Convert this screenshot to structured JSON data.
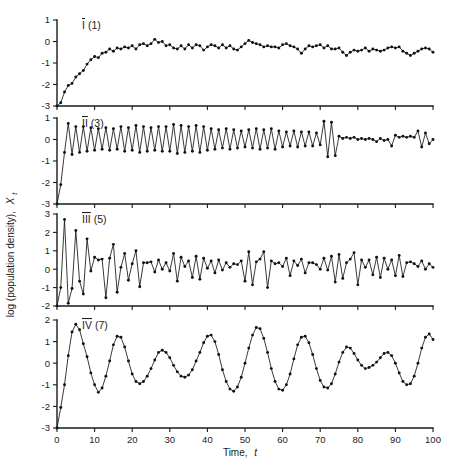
{
  "figure": {
    "y_axis_label_main": "log (population density),",
    "y_axis_label_symbol": "X",
    "y_axis_label_subscript": "t",
    "x_axis_label_main": "Time,",
    "x_axis_label_symbol": "t",
    "background_color": "#ffffff",
    "line_color": "#161616",
    "marker_color": "#111111"
  },
  "chart_data": [
    {
      "type": "line",
      "title": "I (1)",
      "panel_id": "I",
      "panel_number": "(1)",
      "xlabel": "Time, t",
      "ylabel": "log (population density), Xt",
      "xlim": [
        0,
        100
      ],
      "ylim": [
        -3,
        1
      ],
      "xticks": [
        0,
        10,
        20,
        30,
        40,
        50,
        60,
        70,
        80,
        90,
        100
      ],
      "yticks": [
        1,
        0,
        -1,
        -2,
        -3
      ],
      "grid": false,
      "legend": "none",
      "markers": "filled-circle",
      "x": [
        0,
        1,
        2,
        3,
        4,
        5,
        6,
        7,
        8,
        9,
        10,
        11,
        12,
        13,
        14,
        15,
        16,
        17,
        18,
        19,
        20,
        21,
        22,
        23,
        24,
        25,
        26,
        27,
        28,
        29,
        30,
        31,
        32,
        33,
        34,
        35,
        36,
        37,
        38,
        39,
        40,
        41,
        42,
        43,
        44,
        45,
        46,
        47,
        48,
        49,
        50,
        51,
        52,
        53,
        54,
        55,
        56,
        57,
        58,
        59,
        60,
        61,
        62,
        63,
        64,
        65,
        66,
        67,
        68,
        69,
        70,
        71,
        72,
        73,
        74,
        75,
        76,
        77,
        78,
        79,
        80,
        81,
        82,
        83,
        84,
        85,
        86,
        87,
        88,
        89,
        90,
        91,
        92,
        93,
        94,
        95,
        96,
        97,
        98,
        99,
        100
      ],
      "values": [
        -3.0,
        -2.85,
        -2.35,
        -2.05,
        -1.95,
        -1.65,
        -1.5,
        -1.35,
        -1.05,
        -0.85,
        -0.7,
        -0.75,
        -0.55,
        -0.5,
        -0.35,
        -0.45,
        -0.3,
        -0.35,
        -0.25,
        -0.3,
        -0.2,
        -0.35,
        -0.15,
        -0.1,
        -0.2,
        -0.1,
        0.1,
        -0.05,
        0.0,
        -0.2,
        -0.15,
        -0.3,
        -0.35,
        -0.2,
        -0.35,
        -0.15,
        -0.3,
        -0.15,
        -0.2,
        -0.4,
        -0.25,
        -0.15,
        -0.2,
        -0.3,
        -0.15,
        -0.3,
        -0.2,
        -0.35,
        -0.4,
        -0.25,
        -0.1,
        0.05,
        -0.05,
        -0.1,
        -0.15,
        -0.25,
        -0.2,
        -0.25,
        -0.25,
        -0.3,
        -0.15,
        -0.1,
        -0.2,
        -0.25,
        -0.35,
        -0.55,
        -0.35,
        -0.2,
        -0.25,
        -0.2,
        -0.15,
        -0.3,
        -0.2,
        -0.35,
        -0.35,
        -0.3,
        -0.5,
        -0.65,
        -0.5,
        -0.4,
        -0.45,
        -0.4,
        -0.3,
        -0.45,
        -0.35,
        -0.4,
        -0.45,
        -0.4,
        -0.3,
        -0.25,
        -0.3,
        -0.25,
        -0.45,
        -0.55,
        -0.65,
        -0.55,
        -0.45,
        -0.35,
        -0.3,
        -0.35,
        -0.5
      ]
    },
    {
      "type": "line",
      "title": "II (3)",
      "panel_id": "II",
      "panel_number": "(3)",
      "xlabel": "Time, t",
      "ylabel": "log (population density), Xt",
      "xlim": [
        0,
        100
      ],
      "ylim": [
        -3,
        1
      ],
      "xticks": [
        0,
        10,
        20,
        30,
        40,
        50,
        60,
        70,
        80,
        90,
        100
      ],
      "yticks": [
        1,
        0,
        -1,
        -2,
        -3
      ],
      "grid": false,
      "legend": "none",
      "markers": "filled-circle",
      "x": [
        0,
        1,
        2,
        3,
        4,
        5,
        6,
        7,
        8,
        9,
        10,
        11,
        12,
        13,
        14,
        15,
        16,
        17,
        18,
        19,
        20,
        21,
        22,
        23,
        24,
        25,
        26,
        27,
        28,
        29,
        30,
        31,
        32,
        33,
        34,
        35,
        36,
        37,
        38,
        39,
        40,
        41,
        42,
        43,
        44,
        45,
        46,
        47,
        48,
        49,
        50,
        51,
        52,
        53,
        54,
        55,
        56,
        57,
        58,
        59,
        60,
        61,
        62,
        63,
        64,
        65,
        66,
        67,
        68,
        69,
        70,
        71,
        72,
        73,
        74,
        75,
        76,
        77,
        78,
        79,
        80,
        81,
        82,
        83,
        84,
        85,
        86,
        87,
        88,
        89,
        90,
        91,
        92,
        93,
        94,
        95,
        96,
        97,
        98,
        99,
        100
      ],
      "values": [
        -3.0,
        -2.1,
        -0.6,
        0.75,
        -0.7,
        0.6,
        -0.6,
        0.6,
        -0.55,
        0.55,
        -0.5,
        0.5,
        -0.45,
        0.55,
        -0.5,
        0.5,
        -0.45,
        0.6,
        -0.55,
        0.55,
        -0.5,
        0.65,
        -0.6,
        0.6,
        -0.55,
        0.55,
        -0.5,
        0.6,
        -0.55,
        0.6,
        -0.55,
        0.7,
        -0.65,
        0.65,
        -0.6,
        0.6,
        -0.55,
        0.65,
        -0.6,
        0.6,
        -0.5,
        0.5,
        -0.45,
        0.45,
        -0.4,
        0.5,
        -0.45,
        0.45,
        -0.4,
        0.4,
        -0.35,
        0.45,
        -0.4,
        0.5,
        -0.45,
        0.45,
        -0.4,
        0.5,
        -0.45,
        0.4,
        -0.35,
        0.35,
        -0.3,
        0.4,
        -0.35,
        0.35,
        -0.3,
        0.35,
        -0.3,
        0.3,
        -0.25,
        0.85,
        -0.8,
        0.8,
        -0.75,
        0.15,
        0.05,
        0.1,
        0.05,
        0.1,
        0.0,
        0.05,
        0.0,
        0.05,
        0.0,
        -0.1,
        0.05,
        -0.05,
        0.0,
        -0.3,
        0.2,
        0.1,
        0.15,
        0.1,
        0.15,
        0.1,
        0.4,
        -0.35,
        0.3,
        -0.2,
        0.0
      ]
    },
    {
      "type": "line",
      "title": "III (5)",
      "panel_id": "III",
      "panel_number": "(5)",
      "xlabel": "Time, t",
      "ylabel": "log (population density), Xt",
      "xlim": [
        0,
        100
      ],
      "ylim": [
        -2,
        3
      ],
      "xticks": [
        0,
        10,
        20,
        30,
        40,
        50,
        60,
        70,
        80,
        90,
        100
      ],
      "yticks": [
        3,
        2,
        1,
        0,
        -1,
        -2
      ],
      "grid": false,
      "legend": "none",
      "markers": "filled-circle",
      "x": [
        0,
        1,
        2,
        3,
        4,
        5,
        6,
        7,
        8,
        9,
        10,
        11,
        12,
        13,
        14,
        15,
        16,
        17,
        18,
        19,
        20,
        21,
        22,
        23,
        24,
        25,
        26,
        27,
        28,
        29,
        30,
        31,
        32,
        33,
        34,
        35,
        36,
        37,
        38,
        39,
        40,
        41,
        42,
        43,
        44,
        45,
        46,
        47,
        48,
        49,
        50,
        51,
        52,
        53,
        54,
        55,
        56,
        57,
        58,
        59,
        60,
        61,
        62,
        63,
        64,
        65,
        66,
        67,
        68,
        69,
        70,
        71,
        72,
        73,
        74,
        75,
        76,
        77,
        78,
        79,
        80,
        81,
        82,
        83,
        84,
        85,
        86,
        87,
        88,
        89,
        90,
        91,
        92,
        93,
        94,
        95,
        96,
        97,
        98,
        99,
        100
      ],
      "values": [
        -2.0,
        -1.0,
        2.7,
        -1.85,
        -1.05,
        2.1,
        -0.65,
        -1.35,
        1.65,
        -0.1,
        0.65,
        0.5,
        0.55,
        -1.55,
        0.6,
        1.35,
        -1.25,
        0.1,
        0.85,
        -0.6,
        0.3,
        1.0,
        -0.95,
        0.35,
        0.35,
        0.4,
        -0.15,
        0.5,
        0.0,
        0.35,
        -0.1,
        0.85,
        -0.65,
        0.65,
        0.15,
        0.45,
        -0.45,
        0.7,
        -0.55,
        0.6,
        0.05,
        0.45,
        -0.2,
        0.5,
        -0.05,
        0.35,
        0.1,
        0.3,
        0.25,
        0.45,
        -0.65,
        0.95,
        -0.85,
        0.4,
        0.55,
        0.95,
        -1.0,
        0.45,
        0.3,
        0.35,
        0.15,
        0.6,
        -0.35,
        0.45,
        0.2,
        0.55,
        -0.2,
        0.35,
        0.35,
        0.25,
        0.0,
        0.6,
        -0.05,
        0.7,
        -0.7,
        0.8,
        -0.5,
        0.35,
        0.55,
        0.9,
        -0.85,
        0.5,
        0.1,
        0.5,
        -0.3,
        0.65,
        -0.45,
        0.6,
        0.0,
        0.5,
        -0.35,
        0.75,
        -0.4,
        0.35,
        0.4,
        0.3,
        0.15,
        0.45,
        0.0,
        0.3,
        0.1
      ]
    },
    {
      "type": "line",
      "title": "IV (7)",
      "panel_id": "IV",
      "panel_number": "(7)",
      "xlabel": "Time, t",
      "ylabel": "log (population density), Xt",
      "xlim": [
        0,
        100
      ],
      "ylim": [
        -3,
        2
      ],
      "xticks": [
        0,
        10,
        20,
        30,
        40,
        50,
        60,
        70,
        80,
        90,
        100
      ],
      "yticks": [
        2,
        1,
        0,
        -1,
        -2,
        -3
      ],
      "grid": false,
      "legend": "none",
      "markers": "filled-circle",
      "x": [
        0,
        1,
        2,
        3,
        4,
        5,
        6,
        7,
        8,
        9,
        10,
        11,
        12,
        13,
        14,
        15,
        16,
        17,
        18,
        19,
        20,
        21,
        22,
        23,
        24,
        25,
        26,
        27,
        28,
        29,
        30,
        31,
        32,
        33,
        34,
        35,
        36,
        37,
        38,
        39,
        40,
        41,
        42,
        43,
        44,
        45,
        46,
        47,
        48,
        49,
        50,
        51,
        52,
        53,
        54,
        55,
        56,
        57,
        58,
        59,
        60,
        61,
        62,
        63,
        64,
        65,
        66,
        67,
        68,
        69,
        70,
        71,
        72,
        73,
        74,
        75,
        76,
        77,
        78,
        79,
        80,
        81,
        82,
        83,
        84,
        85,
        86,
        87,
        88,
        89,
        90,
        91,
        92,
        93,
        94,
        95,
        96,
        97,
        98,
        99,
        100
      ],
      "values": [
        -3.0,
        -2.05,
        -1.0,
        0.35,
        1.45,
        1.8,
        1.55,
        0.9,
        0.3,
        -0.45,
        -1.0,
        -1.35,
        -1.15,
        -0.6,
        0.1,
        0.85,
        1.25,
        1.2,
        0.75,
        0.1,
        -0.5,
        -0.85,
        -0.95,
        -0.85,
        -0.6,
        -0.25,
        0.15,
        0.5,
        0.6,
        0.5,
        0.25,
        -0.1,
        -0.4,
        -0.6,
        -0.65,
        -0.55,
        -0.3,
        0.1,
        0.5,
        0.95,
        1.25,
        1.3,
        1.0,
        0.4,
        -0.3,
        -0.85,
        -1.2,
        -1.3,
        -1.1,
        -0.65,
        0.0,
        0.7,
        1.3,
        1.65,
        1.6,
        1.15,
        0.5,
        -0.25,
        -0.85,
        -1.2,
        -1.25,
        -1.0,
        -0.5,
        0.2,
        0.85,
        1.2,
        1.25,
        0.95,
        0.4,
        -0.25,
        -0.8,
        -1.1,
        -1.15,
        -0.95,
        -0.5,
        0.05,
        0.5,
        0.75,
        0.7,
        0.45,
        0.15,
        -0.1,
        -0.25,
        -0.2,
        -0.1,
        0.05,
        0.25,
        0.45,
        0.5,
        0.35,
        0.0,
        -0.45,
        -0.85,
        -1.0,
        -0.95,
        -0.6,
        0.0,
        0.7,
        1.2,
        1.35,
        1.1,
        0.45
      ]
    }
  ]
}
